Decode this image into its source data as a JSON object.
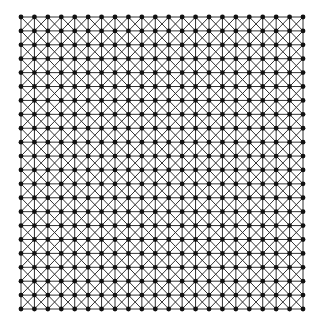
{
  "diagram": {
    "type": "grid-graph-with-diagonals",
    "rows": 22,
    "cols": 22,
    "x_start": 21,
    "x_end": 303,
    "y_start": 17,
    "y_end": 309,
    "edges": [
      "horizontal",
      "vertical",
      "diagonal-down",
      "diagonal-up"
    ],
    "colors": {
      "background": "#ffffff",
      "edge": "#333333",
      "node": "#111111"
    },
    "edge_width": 1,
    "node_radius": 2.4
  }
}
